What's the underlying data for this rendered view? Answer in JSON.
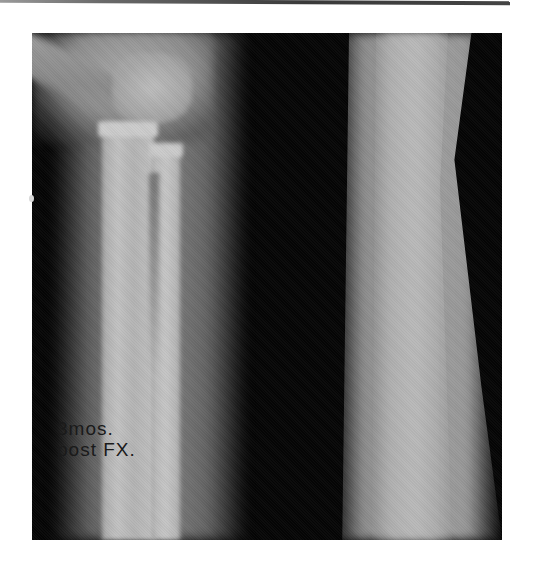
{
  "figure": {
    "annotation": {
      "line1": "3mos.",
      "line2": "post FX."
    }
  }
}
